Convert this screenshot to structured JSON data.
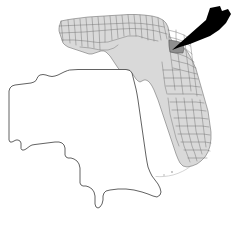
{
  "figure": {
    "name": "county-locator-map",
    "background_color": "#ffffff",
    "width": 235,
    "height": 225
  },
  "state_map": {
    "name": "Florida",
    "fill_color": "#d9d9d9",
    "border_color": "#5a5a5a",
    "county_line_color": "#6e6e6e",
    "subdivisions_label": "counties",
    "position": "upper-right"
  },
  "highlighted_county": {
    "name": "Marion County",
    "fill_color": "#8f8f8f",
    "border_color": "#4a4a4a",
    "center_x": 176,
    "center_y": 47
  },
  "pointer": {
    "name": "arrow-pointer",
    "color": "#000000",
    "tip_x": 172,
    "tip_y": 50,
    "tail_x": 228,
    "tail_y": 10,
    "direction": "down-left"
  },
  "inset_outline": {
    "name": "enlarged-county-outline",
    "fill_color": "#ffffff",
    "stroke_color": "#3a3a3a",
    "position": "lower-left",
    "stroke_width": "0.8"
  },
  "keys": {
    "name": "Florida Keys",
    "stroke_color": "#a8a8a8"
  },
  "labels": {
    "none_visible": ""
  }
}
